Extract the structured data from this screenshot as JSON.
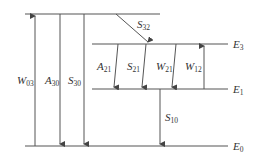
{
  "diagram": {
    "type": "energy-level diagram",
    "levels": [
      {
        "id": "E3_upper",
        "label": "",
        "y": 14
      },
      {
        "id": "E3",
        "label": "E",
        "sub": "3",
        "y": 44
      },
      {
        "id": "E1",
        "label": "E",
        "sub": "1",
        "y": 89
      },
      {
        "id": "E0",
        "label": "E",
        "sub": "0",
        "y": 146
      }
    ],
    "transitions": [
      {
        "label": "W",
        "sub": "03",
        "direction": "up"
      },
      {
        "label": "A",
        "sub": "30",
        "direction": "down"
      },
      {
        "label": "S",
        "sub": "30",
        "direction": "down"
      },
      {
        "label": "S",
        "sub": "32",
        "direction": "down"
      },
      {
        "label": "A",
        "sub": "21",
        "direction": "down"
      },
      {
        "label": "S",
        "sub": "21",
        "direction": "down"
      },
      {
        "label": "W",
        "sub": "21",
        "direction": "down"
      },
      {
        "label": "W",
        "sub": "12",
        "direction": "up"
      },
      {
        "label": "S",
        "sub": "10",
        "direction": "down"
      }
    ]
  }
}
